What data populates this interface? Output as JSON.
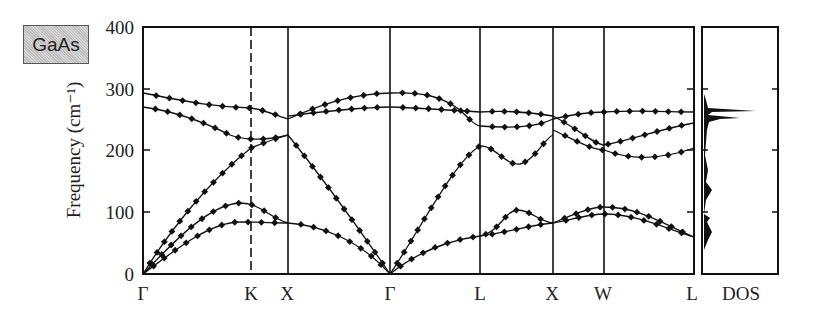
{
  "badge": "GaAs",
  "chart_data": {
    "type": "line",
    "title": "GaAs",
    "xlabel": "",
    "ylabel": "Frequency (cm⁻¹)",
    "ylim": [
      0,
      400
    ],
    "yticks": [
      "0",
      "100",
      "200",
      "300",
      "400"
    ],
    "x_tick_labels": [
      "Γ",
      "K",
      "X",
      "Γ",
      "L",
      "X",
      "W",
      "L"
    ],
    "x_tick_styles": [
      "solid",
      "dashed",
      "solid",
      "solid",
      "solid",
      "solid",
      "solid",
      "solid"
    ],
    "dos_label": "DOS",
    "grid": false,
    "series_note": "Phonon dispersion curves (lines = calculation, diamonds = experiment)",
    "branches": [
      {
        "segment": "Γ-K-X",
        "name": "LO",
        "x": [
          0,
          0.25,
          0.5,
          0.75,
          1.0,
          1.3
        ],
        "values": [
          292,
          282,
          272,
          268,
          262,
          250
        ]
      },
      {
        "segment": "Γ-K-X",
        "name": "TO",
        "x": [
          0,
          0.25,
          0.5,
          0.75,
          1.0,
          1.3
        ],
        "values": [
          270,
          262,
          240,
          222,
          218,
          225
        ]
      },
      {
        "segment": "Γ-K-X",
        "name": "LA",
        "x": [
          0,
          0.25,
          0.5,
          0.75,
          1.0,
          1.3
        ],
        "values": [
          0,
          85,
          140,
          180,
          205,
          225
        ]
      },
      {
        "segment": "Γ-K-X",
        "name": "TA2",
        "x": [
          0,
          0.25,
          0.5,
          0.75,
          1.0,
          1.3
        ],
        "values": [
          0,
          55,
          90,
          110,
          115,
          82
        ]
      },
      {
        "segment": "Γ-K-X",
        "name": "TA1",
        "x": [
          0,
          0.25,
          0.5,
          0.75,
          1.0,
          1.3
        ],
        "values": [
          0,
          45,
          70,
          82,
          85,
          82
        ]
      },
      {
        "segment": "X-Γ",
        "name": "LO",
        "x": [
          0,
          0.25,
          0.5,
          0.75,
          1.0
        ],
        "values": [
          250,
          272,
          285,
          290,
          292
        ]
      },
      {
        "segment": "X-Γ",
        "name": "TO",
        "x": [
          0,
          0.25,
          0.5,
          0.75,
          1.0
        ],
        "values": [
          255,
          262,
          266,
          268,
          270
        ]
      },
      {
        "segment": "X-Γ",
        "name": "LA",
        "x": [
          0,
          0.25,
          0.5,
          0.75,
          1.0
        ],
        "values": [
          225,
          175,
          115,
          55,
          0
        ]
      },
      {
        "segment": "X-Γ",
        "name": "TA",
        "x": [
          0,
          0.25,
          0.5,
          0.75,
          1.0
        ],
        "values": [
          82,
          80,
          62,
          35,
          0
        ]
      },
      {
        "segment": "Γ-L",
        "name": "LO",
        "x": [
          0,
          0.25,
          0.5,
          0.75,
          1.0
        ],
        "values": [
          292,
          290,
          275,
          250,
          240
        ]
      },
      {
        "segment": "Γ-L",
        "name": "TO",
        "x": [
          0,
          0.25,
          0.5,
          0.75,
          1.0
        ],
        "values": [
          270,
          268,
          265,
          262,
          262
        ]
      },
      {
        "segment": "Γ-L",
        "name": "LA",
        "x": [
          0,
          0.25,
          0.5,
          0.75,
          1.0
        ],
        "values": [
          0,
          70,
          135,
          185,
          208
        ]
      },
      {
        "segment": "Γ-L",
        "name": "TA",
        "x": [
          0,
          0.25,
          0.5,
          0.75,
          1.0
        ],
        "values": [
          0,
          35,
          52,
          60,
          62
        ]
      },
      {
        "segment": "L-X",
        "name": "LO",
        "x": [
          0,
          0.25,
          0.5,
          0.75,
          1.0
        ],
        "values": [
          240,
          237,
          235,
          240,
          255
        ]
      },
      {
        "segment": "L-X",
        "name": "TO",
        "x": [
          0,
          0.25,
          0.5,
          0.75,
          1.0
        ],
        "values": [
          262,
          265,
          266,
          262,
          258
        ]
      },
      {
        "segment": "L-X",
        "name": "LA",
        "x": [
          0,
          0.25,
          0.5,
          0.75,
          1.0
        ],
        "values": [
          208,
          195,
          180,
          210,
          228
        ]
      },
      {
        "segment": "L-X",
        "name": "TA",
        "x": [
          0,
          0.25,
          0.5,
          0.75,
          1.0
        ],
        "values": [
          62,
          80,
          105,
          95,
          82
        ]
      },
      {
        "segment": "X-W",
        "name": "optical",
        "x": [
          0,
          0.5,
          1.0
        ],
        "values": [
          228,
          215,
          200
        ]
      },
      {
        "segment": "X-W",
        "name": "acoustic",
        "x": [
          0,
          0.5,
          1.0
        ],
        "values": [
          82,
          100,
          110
        ]
      },
      {
        "segment": "W-L",
        "name": "upper-optical",
        "x": [
          0,
          0.5,
          1.0
        ],
        "values": [
          262,
          265,
          262
        ]
      },
      {
        "segment": "W-L",
        "name": "optical-2",
        "x": [
          0,
          0.5,
          1.0
        ],
        "values": [
          210,
          228,
          240
        ]
      },
      {
        "segment": "W-L",
        "name": "optical-3",
        "x": [
          0,
          0.5,
          1.0
        ],
        "values": [
          200,
          183,
          208
        ]
      },
      {
        "segment": "W-L",
        "name": "acoustic-1",
        "x": [
          0,
          0.5,
          1.0
        ],
        "values": [
          110,
          105,
          62
        ]
      },
      {
        "segment": "W-L",
        "name": "acoustic-2",
        "x": [
          0,
          0.5,
          1.0
        ],
        "values": [
          97,
          88,
          62
        ]
      }
    ],
    "dos_peaks": [
      {
        "frequency": 265,
        "relative_height": 0.75
      },
      {
        "frequency": 252,
        "relative_height": 0.95
      },
      {
        "frequency": 85,
        "relative_height": 0.3
      }
    ]
  }
}
